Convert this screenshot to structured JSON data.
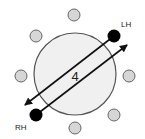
{
  "diagram": {
    "center_label": "4",
    "left_hand_label": "LH",
    "right_hand_label": "RH",
    "colors": {
      "large_circle_fill": "#f0f0f0",
      "large_circle_stroke": "#555555",
      "small_circle_fill": "#d6d6d6",
      "small_circle_stroke": "#666666",
      "hand_dot": "#000000",
      "arrow": "#111111"
    }
  }
}
